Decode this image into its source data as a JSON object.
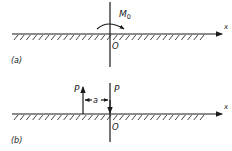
{
  "diagram": {
    "panel_a": {
      "label": "(a)",
      "axis_label": "x",
      "origin_label": "O",
      "moment_label": "M",
      "moment_subscript": "0"
    },
    "panel_b": {
      "label": "(b)",
      "axis_label": "x",
      "origin_label": "O",
      "force_up_label": "P",
      "force_down_label": "P",
      "separation_label": "a"
    }
  }
}
